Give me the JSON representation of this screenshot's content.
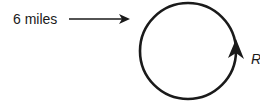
{
  "diagram": {
    "distance_label": "6 miles",
    "radius_label": "R",
    "colors": {
      "stroke": "#1a1a1a",
      "background": "#ffffff"
    },
    "circle": {
      "cx": 188,
      "cy": 51,
      "r": 48
    },
    "pointer_arrow": {
      "x1": 69,
      "y1": 19,
      "x2": 128,
      "y2": 19
    },
    "direction": "counterclockwise-arrow-on-right"
  }
}
